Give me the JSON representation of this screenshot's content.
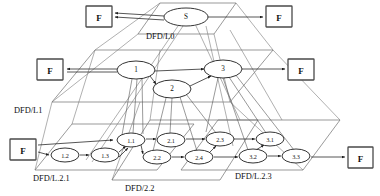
{
  "diagram": {
    "type": "layered-dataflow-diagram",
    "colors": {
      "background": "#ffffff",
      "plane_stroke": "#6e6e6e",
      "flow_stroke": "#2b2b2b",
      "node_fill": "#ffffff",
      "node_stroke": "#1d1d1d",
      "ext_stroke": "#4a4a4a",
      "text": "#111111"
    },
    "planes": [
      {
        "id": "L0",
        "label": "DFD/L0",
        "label_x": 146,
        "label_y": 36
      },
      {
        "id": "L1",
        "label": "DFD/L1",
        "label_x": 14,
        "label_y": 110
      },
      {
        "id": "L2.1",
        "label": "DFD/L.2.1",
        "label_x": 33,
        "label_y": 178
      },
      {
        "id": "L2.2",
        "label": "DFD/2.2",
        "label_x": 125,
        "label_y": 188
      },
      {
        "id": "L2.3",
        "label": "DFD/L.2.3",
        "label_x": 235,
        "label_y": 176
      }
    ],
    "processes": [
      {
        "id": "S",
        "label": "S",
        "level": "L0",
        "cx": 186,
        "cy": 17,
        "rx": 22,
        "ry": 9
      },
      {
        "id": "P1",
        "label": "1",
        "level": "L1",
        "cx": 136,
        "cy": 70,
        "rx": 19,
        "ry": 9
      },
      {
        "id": "P2",
        "label": "2",
        "level": "L1",
        "cx": 172,
        "cy": 89,
        "rx": 19,
        "ry": 9
      },
      {
        "id": "P3",
        "label": "3",
        "level": "L1",
        "cx": 223,
        "cy": 69,
        "rx": 19,
        "ry": 9
      },
      {
        "id": "P11",
        "label": "1.1",
        "level": "L2.1",
        "cx": 131,
        "cy": 140,
        "rx": 14,
        "ry": 7
      },
      {
        "id": "P12",
        "label": "1.2",
        "level": "L2.1",
        "cx": 65,
        "cy": 155,
        "rx": 14,
        "ry": 7
      },
      {
        "id": "P13",
        "label": "1.3",
        "level": "L2.1",
        "cx": 105,
        "cy": 155,
        "rx": 14,
        "ry": 7
      },
      {
        "id": "P21",
        "label": "2.1",
        "level": "L2.2",
        "cx": 171,
        "cy": 140,
        "rx": 14,
        "ry": 7
      },
      {
        "id": "P22",
        "label": "2.2",
        "level": "L2.2",
        "cx": 157,
        "cy": 157,
        "rx": 14,
        "ry": 7
      },
      {
        "id": "P23",
        "label": "2.3",
        "level": "L2.2",
        "cx": 220,
        "cy": 139,
        "rx": 14,
        "ry": 7
      },
      {
        "id": "P24",
        "label": "2.4",
        "level": "L2.2",
        "cx": 199,
        "cy": 157,
        "rx": 14,
        "ry": 7
      },
      {
        "id": "P31",
        "label": "3.1",
        "level": "L2.3",
        "cx": 270,
        "cy": 139,
        "rx": 14,
        "ry": 7
      },
      {
        "id": "P32",
        "label": "3.2",
        "level": "L2.3",
        "cx": 253,
        "cy": 156,
        "rx": 14,
        "ry": 7
      },
      {
        "id": "P33",
        "label": "3.3",
        "level": "L2.3",
        "cx": 296,
        "cy": 156,
        "rx": 14,
        "ry": 7
      }
    ],
    "externals": [
      {
        "id": "F-top-left",
        "label": "F",
        "x": 86,
        "y": 6,
        "w": 26,
        "h": 21
      },
      {
        "id": "F-top-right",
        "label": "F",
        "x": 266,
        "y": 6,
        "w": 26,
        "h": 21
      },
      {
        "id": "F-mid-left",
        "label": "F",
        "x": 37,
        "y": 59,
        "w": 26,
        "h": 21
      },
      {
        "id": "F-mid-right",
        "label": "F",
        "x": 288,
        "y": 59,
        "w": 26,
        "h": 21
      },
      {
        "id": "F-bottom-left",
        "label": "F",
        "x": 10,
        "y": 139,
        "w": 26,
        "h": 21
      },
      {
        "id": "F-bottom-right",
        "label": "F",
        "x": 348,
        "y": 147,
        "w": 25,
        "h": 21
      }
    ],
    "flows": [
      {
        "from": "S",
        "to": "F-top-left",
        "kind": "output"
      },
      {
        "from": "S",
        "to": "F-top-right",
        "kind": "output"
      },
      {
        "from": "P1",
        "to": "F-mid-left",
        "kind": "output"
      },
      {
        "from": "P3",
        "to": "F-mid-right",
        "kind": "output"
      },
      {
        "from": "P1",
        "to": "P2",
        "kind": "internal"
      },
      {
        "from": "P2",
        "to": "P3",
        "kind": "internal"
      },
      {
        "from": "P1",
        "to": "P3",
        "kind": "internal"
      },
      {
        "from": "F-bottom-left",
        "to": "P11",
        "kind": "input"
      },
      {
        "from": "F-bottom-left",
        "to": "P12",
        "kind": "input"
      },
      {
        "from": "P12",
        "to": "P13",
        "kind": "internal"
      },
      {
        "from": "P13",
        "to": "P11",
        "kind": "internal"
      },
      {
        "from": "P11",
        "to": "P21",
        "kind": "internal"
      },
      {
        "from": "P11",
        "to": "P22",
        "kind": "internal"
      },
      {
        "from": "P21",
        "to": "P23",
        "kind": "internal"
      },
      {
        "from": "P22",
        "to": "P24",
        "kind": "internal"
      },
      {
        "from": "P24",
        "to": "P23",
        "kind": "internal"
      },
      {
        "from": "P24",
        "to": "P32",
        "kind": "internal"
      },
      {
        "from": "P23",
        "to": "P31",
        "kind": "internal"
      },
      {
        "from": "P32",
        "to": "P31",
        "kind": "internal"
      },
      {
        "from": "P32",
        "to": "P33",
        "kind": "internal"
      },
      {
        "from": "P33",
        "to": "F-bottom-right",
        "kind": "output"
      }
    ]
  }
}
